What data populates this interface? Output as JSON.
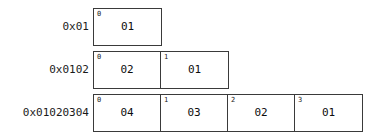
{
  "diagram": {
    "colors": {
      "background": "#ffffff",
      "border": "#3a3a3a",
      "text": "#1a1a1a"
    },
    "rows": [
      {
        "label": "0x01",
        "top": 8,
        "left": 93,
        "cells": [
          {
            "index": "0",
            "value": "01"
          }
        ]
      },
      {
        "label": "0x0102",
        "top": 51,
        "left": 93,
        "cells": [
          {
            "index": "0",
            "value": "02"
          },
          {
            "index": "1",
            "value": "01"
          }
        ]
      },
      {
        "label": "0x01020304",
        "top": 94,
        "left": 93,
        "cells": [
          {
            "index": "0",
            "value": "04"
          },
          {
            "index": "1",
            "value": "03"
          },
          {
            "index": "2",
            "value": "02"
          },
          {
            "index": "3",
            "value": "01"
          }
        ]
      }
    ]
  }
}
